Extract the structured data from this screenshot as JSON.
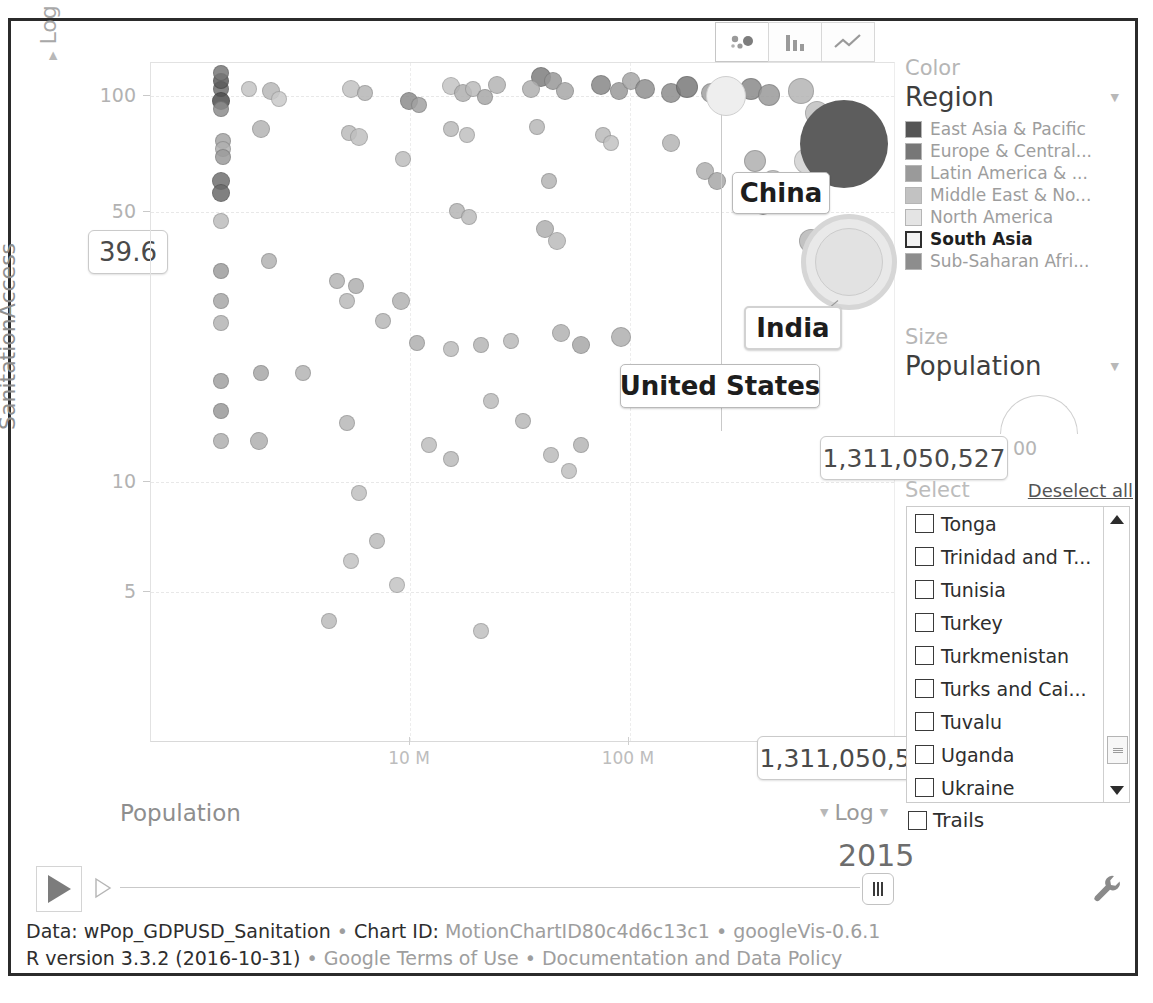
{
  "app": {
    "title": "googleVis Motion Chart"
  },
  "tabs": [
    {
      "name": "bubble-chart-tab",
      "icon": "bubble-chart-icon",
      "active": true
    },
    {
      "name": "bar-chart-tab",
      "icon": "bar-chart-icon",
      "active": false
    },
    {
      "name": "line-chart-tab",
      "icon": "line-chart-icon",
      "active": false
    }
  ],
  "axes": {
    "y": {
      "label": "SanitationAccess",
      "scale": "Log",
      "ticks": [
        "100",
        "50",
        "10",
        "5"
      ],
      "tooltip_value": "39.6"
    },
    "x": {
      "label": "Population",
      "scale": "Log",
      "ticks": [
        "10 M",
        "100 M"
      ],
      "tooltip_value": "1,311,050,527"
    }
  },
  "annotations": [
    {
      "label": "China",
      "tooltip": null
    },
    {
      "label": "India",
      "tooltip": "1,311,050,527"
    },
    {
      "label": "United States",
      "tooltip": null
    }
  ],
  "color_panel": {
    "heading": "Color",
    "selected": "Region",
    "dropdown_icon": "chevron-down-icon",
    "legend": [
      {
        "label": "East Asia & Pacific",
        "color": "#555555",
        "selected": false
      },
      {
        "label": "Europe & Central...",
        "color": "#777777",
        "selected": false
      },
      {
        "label": "Latin America & ...",
        "color": "#9a9a9a",
        "selected": false
      },
      {
        "label": "Middle East & No...",
        "color": "#c2c2c2",
        "selected": false
      },
      {
        "label": "North America",
        "color": "#e4e4e4",
        "selected": false
      },
      {
        "label": "South Asia",
        "color": "#f2f2f2",
        "selected": true
      },
      {
        "label": "Sub-Saharan Afri...",
        "color": "#8d8d8d",
        "selected": false
      }
    ]
  },
  "size_panel": {
    "heading": "Size",
    "selected": "Population",
    "dropdown_icon": "chevron-down-icon",
    "scale_value": "00"
  },
  "select_panel": {
    "heading": "Select",
    "deselect_all": "Deselect all",
    "countries": [
      "Tonga",
      "Trinidad and T...",
      "Tunisia",
      "Turkey",
      "Turkmenistan",
      "Turks and Cai...",
      "Tuvalu",
      "Uganda",
      "Ukraine"
    ],
    "scroll_up_icon": "scroll-up-arrow-icon",
    "scroll_down_icon": "scroll-down-arrow-icon"
  },
  "trails": {
    "label": "Trails",
    "checked": false
  },
  "playback": {
    "play_icon": "play-icon",
    "step_icon": "step-forward-icon",
    "year": "2015",
    "settings_icon": "wrench-icon"
  },
  "footer": {
    "line1": [
      {
        "text": "Data: wPop_GDPUSD_Sanitation",
        "style": "dark"
      },
      {
        "text": " • ",
        "style": "sep"
      },
      {
        "text": "Chart ID: ",
        "style": "dark"
      },
      {
        "text": "MotionChartID80c4d6c13c1",
        "style": "mid"
      },
      {
        "text": " • ",
        "style": "sep"
      },
      {
        "text": "googleVis-0.6.1",
        "style": "mid"
      }
    ],
    "line2": [
      {
        "text": "R version 3.3.2 (2016-10-31)",
        "style": "dark"
      },
      {
        "text": " • ",
        "style": "sep"
      },
      {
        "text": "Google Terms of Use",
        "style": "mid"
      },
      {
        "text": " • ",
        "style": "sep"
      },
      {
        "text": "Documentation and Data Policy",
        "style": "mid"
      }
    ],
    "line1_text": "Data: wPop_GDPUSD_Sanitation • Chart ID: MotionChartID80c4d6c13c1 • googleVis-0.6.1",
    "line2_text": "R version 3.3.2 (2016-10-31) • Google Terms of Use • Documentation and Data Policy"
  },
  "chart_data": {
    "type": "scatter",
    "title": "",
    "xlabel": "Population",
    "ylabel": "SanitationAccess",
    "xscale": "log",
    "yscale": "log",
    "xticks": [
      "10 M",
      "100 M"
    ],
    "yticks": [
      100,
      50,
      10,
      5
    ],
    "xlim": [
      50000,
      2000000000
    ],
    "ylim": [
      4,
      110
    ],
    "grid": true,
    "legend_position": "right",
    "legend_title": "Region",
    "legend_entries": [
      "East Asia & Pacific",
      "Europe & Central...",
      "Latin America & ...",
      "Middle East & No...",
      "North America",
      "South Asia",
      "Sub-Saharan Afri..."
    ],
    "size_encoding": "Population",
    "year": 2015,
    "highlighted_points": [
      {
        "name": "China",
        "population": 1371220000,
        "sanitation_access": 76.5,
        "region": "East Asia & Pacific"
      },
      {
        "name": "India",
        "population": 1311050527,
        "sanitation_access": 39.6,
        "region": "South Asia"
      },
      {
        "name": "United States",
        "population": 321418820,
        "sanitation_access": 100,
        "region": "North America"
      }
    ],
    "points": [
      [
        70,
        652,
        8,
        "#6f6f6f"
      ],
      [
        70,
        660,
        8,
        "#5b5b5b"
      ],
      [
        70,
        668,
        8,
        "#787878"
      ],
      [
        70,
        640,
        9,
        "#4d4d4d"
      ],
      [
        70,
        632,
        8,
        "#8d8d8d"
      ],
      [
        72,
        600,
        8,
        "#a5a5a5"
      ],
      [
        72,
        592,
        8,
        "#b0b0b0"
      ],
      [
        72,
        584,
        8,
        "#9b9b9b"
      ],
      [
        70,
        560,
        9,
        "#707070"
      ],
      [
        70,
        548,
        9,
        "#6a6a6a"
      ],
      [
        70,
        520,
        8,
        "#bdbdbd"
      ],
      [
        70,
        470,
        8,
        "#9d9d9d"
      ],
      [
        70,
        440,
        8,
        "#a8a8a8"
      ],
      [
        70,
        418,
        8,
        "#b5b5b5"
      ],
      [
        70,
        360,
        8,
        "#a0a0a0"
      ],
      [
        70,
        330,
        8,
        "#9a9a9a"
      ],
      [
        70,
        300,
        8,
        "#b0b0b0"
      ],
      [
        98,
        652,
        8,
        "#c5c5c5"
      ],
      [
        120,
        650,
        9,
        "#b8b8b8"
      ],
      [
        128,
        642,
        8,
        "#cacaca"
      ],
      [
        110,
        612,
        9,
        "#b4b4b4"
      ],
      [
        118,
        480,
        8,
        "#b2b2b2"
      ],
      [
        110,
        368,
        8,
        "#a8a8a8"
      ],
      [
        152,
        368,
        8,
        "#b4b4b4"
      ],
      [
        108,
        300,
        9,
        "#b0b0b0"
      ],
      [
        200,
        652,
        9,
        "#c2c2c2"
      ],
      [
        214,
        648,
        8,
        "#b6b6b6"
      ],
      [
        198,
        608,
        8,
        "#bcbcbc"
      ],
      [
        208,
        604,
        9,
        "#c0c0c0"
      ],
      [
        205,
        455,
        8,
        "#b0b0b0"
      ],
      [
        196,
        440,
        8,
        "#bababa"
      ],
      [
        196,
        318,
        8,
        "#b8b8b8"
      ],
      [
        208,
        248,
        8,
        "#c0c0c0"
      ],
      [
        226,
        200,
        8,
        "#bcbcbc"
      ],
      [
        258,
        640,
        9,
        "#8c8c8c"
      ],
      [
        268,
        636,
        8,
        "#a2a2a2"
      ],
      [
        252,
        582,
        8,
        "#bebebe"
      ],
      [
        250,
        440,
        9,
        "#b2b2b2"
      ],
      [
        300,
        655,
        9,
        "#c4c4c4"
      ],
      [
        312,
        648,
        9,
        "#b0b0b0"
      ],
      [
        322,
        652,
        8,
        "#bcbcbc"
      ],
      [
        334,
        644,
        8,
        "#a8a8a8"
      ],
      [
        346,
        656,
        9,
        "#b4b4b4"
      ],
      [
        300,
        612,
        8,
        "#bababa"
      ],
      [
        316,
        606,
        8,
        "#c0c0c0"
      ],
      [
        306,
        530,
        8,
        "#b6b6b6"
      ],
      [
        318,
        524,
        8,
        "#bcbcbc"
      ],
      [
        390,
        664,
        10,
        "#7e7e7e"
      ],
      [
        402,
        660,
        9,
        "#989898"
      ],
      [
        380,
        652,
        9,
        "#b0b0b0"
      ],
      [
        414,
        650,
        9,
        "#a8a8a8"
      ],
      [
        386,
        614,
        8,
        "#b8b8b8"
      ],
      [
        398,
        560,
        8,
        "#b4b4b4"
      ],
      [
        394,
        512,
        9,
        "#b0b0b0"
      ],
      [
        406,
        500,
        9,
        "#bcbcbc"
      ],
      [
        450,
        656,
        10,
        "#888888"
      ],
      [
        468,
        650,
        9,
        "#9a9a9a"
      ],
      [
        480,
        660,
        9,
        "#a6a6a6"
      ],
      [
        494,
        652,
        10,
        "#909090"
      ],
      [
        452,
        606,
        8,
        "#bababa"
      ],
      [
        460,
        598,
        8,
        "#c2c2c2"
      ],
      [
        520,
        648,
        10,
        "#8e8e8e"
      ],
      [
        536,
        654,
        11,
        "#7a7a7a"
      ],
      [
        560,
        648,
        10,
        "#a0a0a0"
      ],
      [
        520,
        598,
        9,
        "#b4b4b4"
      ],
      [
        554,
        570,
        9,
        "#b0b0b0"
      ],
      [
        566,
        560,
        9,
        "#a8a8a8"
      ],
      [
        600,
        652,
        11,
        "#8a8a8a"
      ],
      [
        618,
        646,
        11,
        "#9a9a9a"
      ],
      [
        604,
        580,
        11,
        "#b0b0b0"
      ],
      [
        622,
        560,
        11,
        "#bcbcbc"
      ],
      [
        612,
        536,
        10,
        "#a0a0a0"
      ],
      [
        650,
        650,
        13,
        "#b4b4b4"
      ],
      [
        666,
        628,
        12,
        "#c0c0c0"
      ],
      [
        656,
        580,
        13,
        "#d2d2d2"
      ],
      [
        684,
        572,
        14,
        "#8a8a8a"
      ],
      [
        660,
        500,
        12,
        "#b8b8b8"
      ],
      [
        186,
        460,
        8,
        "#b4b4b4"
      ],
      [
        232,
        420,
        8,
        "#b8b8b8"
      ],
      [
        266,
        398,
        8,
        "#b0b0b0"
      ],
      [
        300,
        392,
        8,
        "#bcbcbc"
      ],
      [
        330,
        396,
        8,
        "#b6b6b6"
      ],
      [
        360,
        400,
        8,
        "#bababa"
      ],
      [
        410,
        408,
        9,
        "#b2b2b2"
      ],
      [
        430,
        396,
        9,
        "#a8a8a8"
      ],
      [
        470,
        404,
        10,
        "#b0b0b0"
      ],
      [
        340,
        340,
        8,
        "#bcbcbc"
      ],
      [
        372,
        320,
        8,
        "#b8b8b8"
      ],
      [
        278,
        296,
        8,
        "#bebebe"
      ],
      [
        300,
        282,
        8,
        "#bababa"
      ],
      [
        430,
        296,
        8,
        "#b6b6b6"
      ],
      [
        400,
        286,
        8,
        "#bcbcbc"
      ],
      [
        418,
        270,
        8,
        "#c0c0c0"
      ],
      [
        200,
        180,
        8,
        "#c2c2c2"
      ],
      [
        246,
        156,
        8,
        "#c4c4c4"
      ],
      [
        178,
        120,
        8,
        "#bcbcbc"
      ],
      [
        330,
        110,
        8,
        "#c0c0c0"
      ]
    ]
  }
}
